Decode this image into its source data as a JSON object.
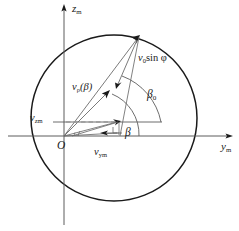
{
  "figure": {
    "type": "vector-decomposition-diagram",
    "background_color": "#ffffff",
    "stroke_color": "#1a1a1a",
    "dashed_color": "#7a7a7a",
    "axes": {
      "vertical_label": "z",
      "vertical_subscript": "m",
      "horizontal_label": "y",
      "horizontal_subscript": "m",
      "origin_label": "O"
    },
    "circle": {
      "center_x": 114,
      "center_y": 118,
      "radius": 83
    },
    "labels": [
      {
        "name": "z-axis-label",
        "base": "z",
        "sub": "m",
        "x": 72,
        "y": 3
      },
      {
        "name": "y-axis-label",
        "base": "y",
        "sub": "m",
        "x": 221,
        "y": 141
      },
      {
        "name": "origin-label",
        "base": "O",
        "sub": "",
        "x": 57,
        "y": 140
      },
      {
        "name": "v0-sin-phi-label",
        "base": "v",
        "sub": "0",
        "suffix": "sin φ",
        "x": 138,
        "y": 53
      },
      {
        "name": "v-rho-beta-label",
        "base": "v",
        "sub": "ρ",
        "suffix": "(β)",
        "x": 72,
        "y": 82
      },
      {
        "name": "beta-zero-label",
        "base": "β",
        "sub": "0",
        "x": 147,
        "y": 89
      },
      {
        "name": "beta-label",
        "base": "β",
        "sub": "",
        "x": 125,
        "y": 127
      },
      {
        "name": "v-zm-label",
        "base": "v",
        "sub": "zm",
        "x": 30,
        "y": 113
      },
      {
        "name": "v-ym-label",
        "base": "v",
        "sub": "ym",
        "x": 94,
        "y": 147
      }
    ]
  }
}
